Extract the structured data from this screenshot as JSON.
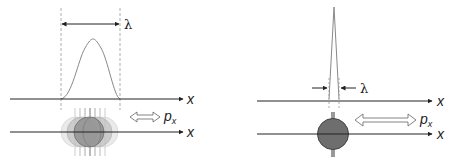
{
  "left_panel": {
    "wavelength_label": "λ",
    "upper_axis_label": "x",
    "lower_axis_label": "x",
    "momentum_label": "p",
    "momentum_subscript": "x"
  },
  "right_panel": {
    "wavelength_label": "λ",
    "upper_axis_label": "x",
    "lower_axis_label": "x",
    "momentum_label": "p",
    "momentum_subscript": "x"
  },
  "colors": {
    "axis": "#222222",
    "curve": "#888888",
    "dashed": "#999999",
    "particle_fill": "#6e6e6e",
    "particle_stroke": "#444444"
  }
}
